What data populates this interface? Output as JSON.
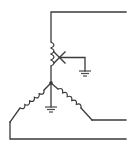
{
  "diagram": {
    "type": "wye-connected transformer windings schematic",
    "components": [
      {
        "name": "upper-winding",
        "kind": "inductor-coil"
      },
      {
        "name": "tap-contact",
        "kind": "x-mark"
      },
      {
        "name": "upper-ground",
        "kind": "ground-symbol"
      },
      {
        "name": "left-winding",
        "kind": "inductor-coil"
      },
      {
        "name": "right-winding",
        "kind": "inductor-coil"
      },
      {
        "name": "neutral-ground",
        "kind": "ground-symbol"
      },
      {
        "name": "neutral-junction",
        "kind": "dot"
      }
    ],
    "terminals": [
      "top-line",
      "middle-line",
      "bottom-line"
    ],
    "colors": {
      "stroke": "#3a3a3a",
      "background": "#ffffff"
    }
  }
}
